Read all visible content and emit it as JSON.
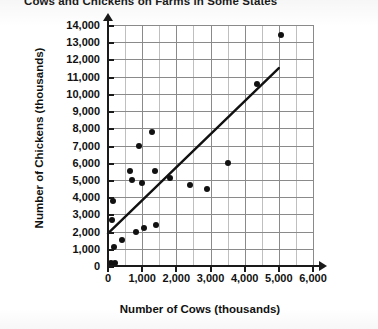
{
  "chart_data": {
    "type": "scatter",
    "title": "Cows and Chickens on Farms in Some States",
    "xlabel": "Number of Cows (thousands)",
    "ylabel": "Number of Chickens (thousands)",
    "xlim": [
      0,
      6000
    ],
    "ylim": [
      0,
      14000
    ],
    "xticks": [
      0,
      1000,
      2000,
      3000,
      4000,
      5000,
      6000
    ],
    "xtick_labels": [
      "0",
      "1,000",
      "2,000",
      "3,000",
      "4,000",
      "5,000",
      "6,000"
    ],
    "yticks": [
      0,
      1000,
      2000,
      3000,
      4000,
      5000,
      6000,
      7000,
      8000,
      9000,
      10000,
      11000,
      12000,
      13000,
      14000
    ],
    "ytick_labels": [
      "0",
      "1,000",
      "2,000",
      "3,000",
      "4,000",
      "5,000",
      "6,000",
      "7,000",
      "8,000",
      "9,000",
      "10,000",
      "11,000",
      "12,000",
      "13,000",
      "14,000"
    ],
    "grid": true,
    "legend": null,
    "marker_color": "#111111",
    "line_color": "#111111",
    "grid_color": "#8a8a8a",
    "points": [
      {
        "x": 90,
        "y": 150
      },
      {
        "x": 200,
        "y": 180
      },
      {
        "x": 120,
        "y": 2700
      },
      {
        "x": 180,
        "y": 1100
      },
      {
        "x": 160,
        "y": 3800
      },
      {
        "x": 420,
        "y": 1500
      },
      {
        "x": 640,
        "y": 5500
      },
      {
        "x": 700,
        "y": 5000
      },
      {
        "x": 830,
        "y": 2000
      },
      {
        "x": 900,
        "y": 7000
      },
      {
        "x": 1000,
        "y": 4800
      },
      {
        "x": 1050,
        "y": 2200
      },
      {
        "x": 1300,
        "y": 7800
      },
      {
        "x": 1370,
        "y": 5500
      },
      {
        "x": 1400,
        "y": 2400
      },
      {
        "x": 1800,
        "y": 5100
      },
      {
        "x": 2400,
        "y": 4700
      },
      {
        "x": 2900,
        "y": 4500
      },
      {
        "x": 3500,
        "y": 6000
      },
      {
        "x": 4350,
        "y": 10600
      },
      {
        "x": 5050,
        "y": 13400
      }
    ],
    "trend_line": {
      "name": "line of best fit",
      "x1": 0,
      "y1": 1900,
      "x2": 5000,
      "y2": 11500
    }
  }
}
